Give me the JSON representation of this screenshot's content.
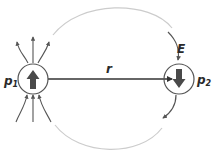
{
  "diagram": {
    "labels": {
      "p1": "p",
      "p1_sub": "1",
      "p2": "p",
      "p2_sub": "2",
      "r": "r",
      "E": "E"
    },
    "colors": {
      "field_line": "#555555",
      "loop": "#cccccc",
      "circle": "#555555",
      "dipole_arrow": "#4a4a4a",
      "axis": "#333333",
      "text": "#2a2a2a"
    },
    "dipoles": [
      {
        "name": "p1",
        "direction": "up"
      },
      {
        "name": "p2",
        "direction": "down"
      }
    ]
  }
}
